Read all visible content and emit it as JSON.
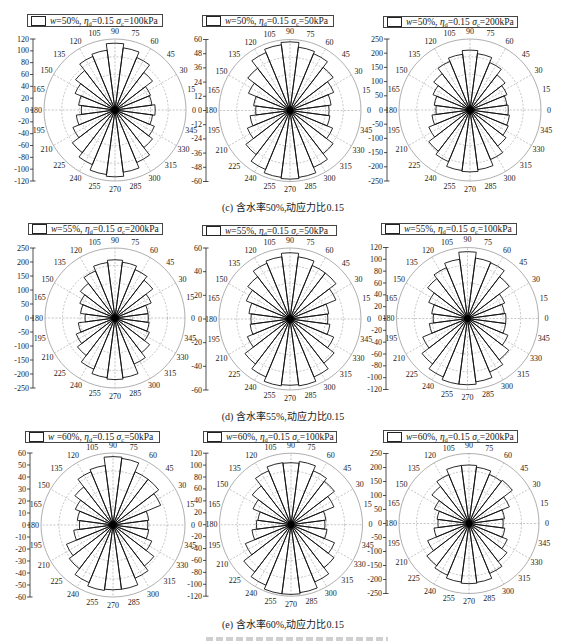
{
  "captions": {
    "c": "(c) 含水率50%,动应力比0.15",
    "d": "(d) 含水率55%,动应力比0.15",
    "e": "(e) 含水率60%,动应力比0.15"
  },
  "chart_data": [
    {
      "type": "rose",
      "group": "(c)",
      "title": "w=50%, η_d=0.15 σ_c=100kPa",
      "legend": {
        "w_sym": "w",
        "w_eq": "=50%, ",
        "eta_sym": "η",
        "eta_sub": "d",
        "eta_eq": "=0.15 ",
        "sigma_sym": "σ",
        "sigma_sub": "c",
        "sigma_eq": "=100kPa"
      },
      "ylim": [
        -120,
        120
      ],
      "yticks": [
        "120",
        "100",
        "80",
        "60",
        "40",
        "20",
        "0",
        "-20",
        "-40",
        "-60",
        "-80",
        "-100",
        "-120"
      ],
      "bin_width": 15,
      "theta": [
        0,
        15,
        30,
        45,
        60,
        75,
        90,
        105,
        120,
        135,
        150,
        165,
        180,
        195,
        210,
        225,
        240,
        255,
        270,
        285,
        300,
        315,
        330,
        345
      ],
      "theta_labels": [
        "0",
        "15",
        "30",
        "45",
        "60",
        "75",
        "90",
        "105",
        "120",
        "135",
        "150",
        "165",
        "180",
        "195",
        "210",
        "225",
        "240",
        "255",
        "270",
        "285",
        "300",
        "315",
        "330",
        "345"
      ],
      "values": [
        68,
        63,
        65,
        80,
        96,
        106,
        113,
        102,
        98,
        84,
        73,
        62,
        57,
        66,
        77,
        91,
        100,
        110,
        113,
        106,
        96,
        80,
        72,
        64
      ]
    },
    {
      "type": "rose",
      "group": "(c)",
      "title": "w=50%, η_d=0.15 σ_c=50kPa",
      "legend": {
        "w_sym": "w",
        "w_eq": "=50%, ",
        "eta_sym": "η",
        "eta_sub": "d",
        "eta_eq": "=0.15 ",
        "sigma_sym": "σ",
        "sigma_sub": "c",
        "sigma_eq": "=50kPa"
      },
      "ylim": [
        -60,
        60
      ],
      "yticks": [
        "60",
        "48",
        "36",
        "24",
        "12",
        "0",
        "-12",
        "-24",
        "-36",
        "-48",
        "-60"
      ],
      "bin_width": 15,
      "theta": [
        0,
        15,
        30,
        45,
        60,
        75,
        90,
        105,
        120,
        135,
        150,
        165,
        180,
        195,
        210,
        225,
        240,
        255,
        270,
        285,
        300,
        315,
        330,
        345
      ],
      "theta_labels": [
        "0",
        "15",
        "30",
        "45",
        "60",
        "75",
        "90",
        "105",
        "120",
        "135",
        "150",
        "165",
        "180",
        "195",
        "210",
        "225",
        "240",
        "255",
        "270",
        "285",
        "300",
        "315",
        "330",
        "345"
      ],
      "values": [
        33,
        35,
        40,
        46,
        52,
        54,
        58,
        56,
        53,
        45,
        38,
        31,
        29,
        34,
        39,
        47,
        54,
        57,
        58,
        57,
        52,
        46,
        39,
        34
      ]
    },
    {
      "type": "rose",
      "group": "(c)",
      "title": "w=50%, η_d=0.15 σ_c=200kPa",
      "legend": {
        "w_sym": "w",
        "w_eq": "=50%, ",
        "eta_sym": "η",
        "eta_sub": "d",
        "eta_eq": "=0.15 ",
        "sigma_sym": "σ",
        "sigma_sub": "c",
        "sigma_eq": "=200kPa"
      },
      "ylim": [
        -250,
        250
      ],
      "yticks": [
        "250",
        "200",
        "150",
        "100",
        "50",
        "0",
        "-50",
        "-100",
        "-150",
        "-200",
        "-250"
      ],
      "bin_width": 15,
      "theta": [
        0,
        15,
        30,
        45,
        60,
        75,
        90,
        105,
        120,
        135,
        150,
        165,
        180,
        195,
        210,
        225,
        240,
        255,
        270,
        285,
        300,
        315,
        330,
        345
      ],
      "theta_labels": [
        "0",
        "15",
        "30",
        "45",
        "60",
        "75",
        "90",
        "105",
        "120",
        "135",
        "150",
        "165",
        "180",
        "195",
        "210",
        "225",
        "240",
        "255",
        "270",
        "285",
        "300",
        "315",
        "330",
        "345"
      ],
      "values": [
        135,
        131,
        141,
        156,
        181,
        200,
        211,
        198,
        185,
        161,
        141,
        127,
        120,
        135,
        157,
        183,
        197,
        215,
        218,
        212,
        189,
        160,
        146,
        140
      ]
    },
    {
      "type": "rose",
      "group": "(d)",
      "title": "w=55%, η_d=0.15 σ_c=200kPa",
      "legend": {
        "w_sym": "w",
        "w_eq": "=55%, ",
        "eta_sym": "η",
        "eta_sub": "d",
        "eta_eq": "=0.15 ",
        "sigma_sym": "σ",
        "sigma_sub": "c",
        "sigma_eq": "=200kPa"
      },
      "ylim": [
        -250,
        250
      ],
      "yticks": [
        "250",
        "200",
        "150",
        "100",
        "50",
        "0",
        "-50",
        "-100",
        "-150",
        "-200",
        "-250"
      ],
      "bin_width": 15,
      "theta": [
        0,
        15,
        30,
        45,
        60,
        75,
        90,
        105,
        120,
        135,
        150,
        165,
        180,
        195,
        210,
        225,
        240,
        255,
        270,
        285,
        300,
        315,
        330,
        345
      ],
      "theta_labels": [
        "0",
        "15",
        "30",
        "45",
        "60",
        "75",
        "90",
        "105",
        "120",
        "135",
        "150",
        "165",
        "180",
        "195",
        "210",
        "225",
        "240",
        "255",
        "270",
        "285",
        "300",
        "315",
        "330",
        "345"
      ],
      "values": [
        119,
        119,
        140,
        170,
        187,
        201,
        208,
        200,
        182,
        156,
        136,
        124,
        107,
        132,
        150,
        169,
        198,
        215,
        220,
        215,
        178,
        156,
        133,
        123
      ]
    },
    {
      "type": "rose",
      "group": "(d)",
      "title": "w=55%, η_d=0.15 σ_c=50kPa",
      "legend": {
        "w_sym": "w",
        "w_eq": "=55%, ",
        "eta_sym": "η",
        "eta_sub": "d",
        "eta_eq": "=0.15 ",
        "sigma_sym": "σ",
        "sigma_sub": "c",
        "sigma_eq": "=50kPa"
      },
      "ylim": [
        -60,
        60
      ],
      "yticks": [
        "60",
        "40",
        "20",
        "0",
        "-20",
        "-40",
        "-60"
      ],
      "bin_width": 15,
      "theta": [
        0,
        15,
        30,
        45,
        60,
        75,
        90,
        105,
        120,
        135,
        150,
        165,
        180,
        195,
        210,
        225,
        240,
        255,
        270,
        285,
        300,
        315,
        330,
        345
      ],
      "theta_labels": [
        "0",
        "15",
        "30",
        "45",
        "60",
        "75",
        "90",
        "105",
        "120",
        "135",
        "150",
        "165",
        "180",
        "195",
        "210",
        "225",
        "240",
        "255",
        "270",
        "285",
        "300",
        "315",
        "330",
        "345"
      ],
      "values": [
        32,
        33,
        42,
        49,
        49,
        53,
        56,
        53,
        51,
        45,
        40,
        35,
        33,
        34,
        39,
        48,
        53,
        57,
        56,
        57,
        53,
        47,
        40,
        34
      ]
    },
    {
      "type": "rose",
      "group": "(d)",
      "title": "w=55%, η_d=0.15 σ_c=100kPa",
      "legend": {
        "w_sym": "w",
        "w_eq": "=55%, ",
        "eta_sym": "η",
        "eta_sub": "d",
        "eta_eq": "=0.15 ",
        "sigma_sym": "σ",
        "sigma_sub": "c",
        "sigma_eq": "=100kPa"
      },
      "ylim": [
        -120,
        120
      ],
      "yticks": [
        "120",
        "100",
        "80",
        "60",
        "40",
        "20",
        "0",
        "-20",
        "-40",
        "-60",
        "-80",
        "-100",
        "-120"
      ],
      "bin_width": 15,
      "theta": [
        0,
        15,
        30,
        45,
        60,
        75,
        90,
        105,
        120,
        135,
        150,
        165,
        180,
        195,
        210,
        225,
        240,
        255,
        270,
        285,
        300,
        315,
        330,
        345
      ],
      "theta_labels": [
        "0",
        "15",
        "30",
        "45",
        "60",
        "75",
        "90",
        "105",
        "120",
        "135",
        "150",
        "165",
        "180",
        "195",
        "210",
        "225",
        "240",
        "255",
        "270",
        "285",
        "300",
        "315",
        "330",
        "345"
      ],
      "values": [
        65,
        63,
        68,
        89,
        102,
        103,
        113,
        101,
        93,
        85,
        71,
        61,
        58,
        65,
        82,
        97,
        107,
        112,
        112,
        108,
        98,
        88,
        74,
        65
      ]
    },
    {
      "type": "rose",
      "group": "(e)",
      "title": "w =60%, η_d=0.15 σ_c=50kPa",
      "legend": {
        "w_sym": "w",
        "w_eq": " =60%, ",
        "eta_sym": "η",
        "eta_sub": "d",
        "eta_eq": "=0.15 ",
        "sigma_sym": "σ",
        "sigma_sub": "c",
        "sigma_eq": "=50kPa"
      },
      "ylim": [
        -60,
        60
      ],
      "yticks": [
        "60",
        "50",
        "40",
        "30",
        "20",
        "10",
        "0",
        "-10",
        "-20",
        "-30",
        "-40",
        "-50",
        "-60"
      ],
      "bin_width": 15,
      "theta": [
        0,
        15,
        30,
        45,
        60,
        75,
        90,
        105,
        120,
        135,
        150,
        165,
        180,
        195,
        210,
        225,
        240,
        255,
        270,
        285,
        300,
        315,
        330,
        345
      ],
      "theta_labels": [
        "0",
        "15",
        "30",
        "45",
        "60",
        "75",
        "90",
        "105",
        "120",
        "135",
        "150",
        "165",
        "180",
        "195",
        "210",
        "225",
        "240",
        "255",
        "270",
        "285",
        "300",
        "315",
        "330",
        "345"
      ],
      "values": [
        29,
        30,
        43,
        48,
        48,
        56,
        57,
        50,
        48,
        40,
        34,
        30,
        28,
        33,
        42,
        46,
        52,
        55,
        54,
        54,
        48,
        43,
        35,
        30
      ]
    },
    {
      "type": "rose",
      "group": "(e)",
      "title": "w=60%, η_d=0.15 σ_c=100kPa",
      "legend": {
        "w_sym": "w",
        "w_eq": "=60%, ",
        "eta_sym": "η",
        "eta_sub": "d",
        "eta_eq": "=0.15 ",
        "sigma_sym": "σ",
        "sigma_sub": "c",
        "sigma_eq": "=100kPa"
      },
      "ylim": [
        -120,
        120
      ],
      "yticks": [
        "120",
        "100",
        "80",
        "60",
        "40",
        "20",
        "0",
        "-20",
        "-40",
        "-60",
        "-80",
        "-100",
        "-120"
      ],
      "bin_width": 15,
      "theta": [
        0,
        15,
        30,
        45,
        60,
        75,
        90,
        105,
        120,
        135,
        150,
        165,
        180,
        195,
        210,
        225,
        240,
        255,
        270,
        285,
        300,
        315,
        330,
        345
      ],
      "theta_labels": [
        "0",
        "15",
        "30",
        "45",
        "60",
        "75",
        "90",
        "105",
        "120",
        "135",
        "150",
        "165",
        "180",
        "195",
        "210",
        "225",
        "240",
        "255",
        "270",
        "285",
        "300",
        "315",
        "330",
        "345"
      ],
      "values": [
        57,
        59,
        78,
        92,
        98,
        107,
        104,
        105,
        98,
        82,
        69,
        56,
        58,
        66,
        83,
        100,
        110,
        117,
        117,
        115,
        104,
        91,
        79,
        61
      ]
    },
    {
      "type": "rose",
      "group": "(e)",
      "title": "w=60%, η_d=0.15 σ_c=200kPa",
      "legend": {
        "w_sym": "w",
        "w_eq": "=60%, ",
        "eta_sym": "η",
        "eta_sub": "d",
        "eta_eq": "=0.15 ",
        "sigma_sym": "σ",
        "sigma_sub": "c",
        "sigma_eq": "=200kPa"
      },
      "ylim": [
        -250,
        250
      ],
      "yticks": [
        "250",
        "200",
        "150",
        "100",
        "50",
        "0",
        "-50",
        "-100",
        "-150",
        "-200",
        "-250"
      ],
      "bin_width": 15,
      "theta": [
        0,
        15,
        30,
        45,
        60,
        75,
        90,
        105,
        120,
        135,
        150,
        165,
        180,
        195,
        210,
        225,
        240,
        255,
        270,
        285,
        300,
        315,
        330,
        345
      ],
      "theta_labels": [
        "0",
        "15",
        "30",
        "45",
        "60",
        "75",
        "90",
        "105",
        "120",
        "135",
        "150",
        "165",
        "180",
        "195",
        "210",
        "225",
        "240",
        "255",
        "270",
        "285",
        "300",
        "315",
        "330",
        "345"
      ],
      "values": [
        122,
        128,
        156,
        195,
        190,
        203,
        209,
        209,
        189,
        167,
        134,
        115,
        111,
        126,
        160,
        190,
        200,
        211,
        215,
        212,
        193,
        171,
        148,
        129
      ]
    }
  ]
}
